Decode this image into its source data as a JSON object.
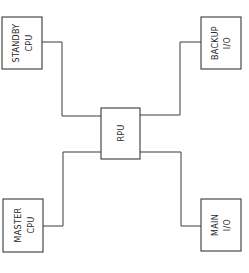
{
  "diagram": {
    "type": "block-diagram",
    "nodes": {
      "standby_cpu": {
        "line1": "STANDBY",
        "line2": "CPU"
      },
      "backup_io": {
        "line1": "BACKUP",
        "line2": "I/O"
      },
      "rpu": {
        "line1": "RPU"
      },
      "master_cpu": {
        "line1": "MASTER",
        "line2": "CPU"
      },
      "main_io": {
        "line1": "MAIN",
        "line2": "I/O"
      }
    },
    "edges": [
      {
        "from": "STANDBY CPU",
        "to": "RPU"
      },
      {
        "from": "BACKUP I/O",
        "to": "RPU"
      },
      {
        "from": "MASTER CPU",
        "to": "RPU"
      },
      {
        "from": "MAIN I/O",
        "to": "RPU"
      }
    ],
    "colors": {
      "line": "#3a3a3a",
      "text": "#2a2a2a",
      "background": "#ffffff"
    }
  }
}
